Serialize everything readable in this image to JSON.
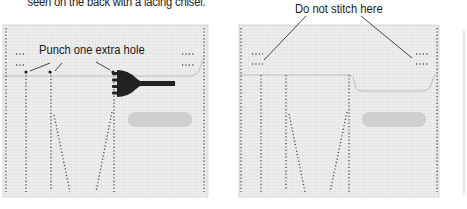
{
  "caption": "seen on the back with a lacing chisel.",
  "panels": [
    {
      "id": "left",
      "label": "Punch one extra hole",
      "tool_icon": "pricking-iron-icon"
    },
    {
      "id": "right",
      "label": "Do not stitch here"
    }
  ],
  "colors": {
    "panel_fill": "#ececec",
    "grid_line": "#d6d6d6",
    "stitch_dot": "#555555",
    "edge_line": "#b8b8b8",
    "pill": "#cfcfcf",
    "tool": "#222222",
    "leader": "#333333"
  }
}
